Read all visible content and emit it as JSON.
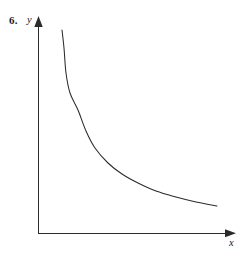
{
  "figure": {
    "problem_number": "6.",
    "background_color": "#ffffff",
    "width": 245,
    "height": 263
  },
  "chart_data": {
    "type": "line",
    "title": "",
    "subtitle": "",
    "xlabel": "x",
    "ylabel": "y",
    "legend": [],
    "legend_position": "none",
    "grid": false,
    "tick_labels_x": [],
    "tick_labels_y": [],
    "axis_style": "arrow-terminated first-quadrant axes",
    "curve_color": "#2b2b2b",
    "axis_color": "#2b2b2b",
    "series": [
      {
        "name": "decaying-curve",
        "points_px": [
          [
            62,
            30
          ],
          [
            64,
            48
          ],
          [
            66,
            73
          ],
          [
            70,
            93
          ],
          [
            78,
            110
          ],
          [
            86,
            131
          ],
          [
            95,
            148
          ],
          [
            108,
            163
          ],
          [
            122,
            174
          ],
          [
            138,
            183
          ],
          [
            156,
            191
          ],
          [
            176,
            197
          ],
          [
            196,
            202
          ],
          [
            217,
            206
          ]
        ]
      }
    ],
    "axes_px": {
      "origin": [
        38,
        233
      ],
      "y_axis_top": [
        38,
        20
      ],
      "x_axis_right": [
        232,
        233
      ]
    },
    "xlim": [
      0,
      245
    ],
    "ylim": [
      0,
      263
    ]
  },
  "labels": {
    "x_axis": "x",
    "y_axis": "y"
  },
  "icons": {
    "y_axis_arrow": "arrow-up-icon",
    "x_axis_arrow": "arrow-right-icon"
  }
}
